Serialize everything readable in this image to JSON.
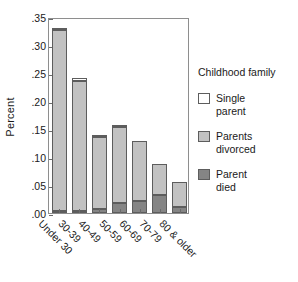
{
  "chart_data": {
    "type": "bar",
    "stacked": true,
    "title": "",
    "subtitle": "",
    "xlabel": "",
    "ylabel": "Percent",
    "categories": [
      "Under 30",
      "30-39",
      "40-49",
      "50-59",
      "60-69",
      "70-79",
      "80 & older"
    ],
    "ylim": [
      0.0,
      0.35
    ],
    "ytick_labels": [
      ".00",
      ".05",
      ".10",
      ".15",
      ".20",
      ".25",
      ".30",
      ".35"
    ],
    "ytick_values": [
      0.0,
      0.05,
      0.1,
      0.15,
      0.2,
      0.25,
      0.3,
      0.35
    ],
    "grid": false,
    "legend_position": "right",
    "legend_title": "Childhood family",
    "series": [
      {
        "name": "Parent died",
        "color": "#858585",
        "values": [
          0.004,
          0.004,
          0.008,
          0.018,
          0.022,
          0.032,
          0.011
        ]
      },
      {
        "name": "Parents divorced",
        "color": "#c2c2c2",
        "values": [
          0.323,
          0.231,
          0.127,
          0.135,
          0.107,
          0.056,
          0.044
        ]
      },
      {
        "name": "Single parent",
        "color": "#ffffff",
        "values": [
          0.004,
          0.006,
          0.005,
          0.004,
          0.0,
          0.0,
          0.0
        ]
      }
    ],
    "totals": [
      0.331,
      0.241,
      0.14,
      0.157,
      0.129,
      0.088,
      0.055
    ]
  },
  "legend": {
    "title": "Childhood family",
    "items": [
      {
        "label_line1": "Single",
        "label_line2": "parent",
        "swatch": "white-swatch"
      },
      {
        "label_line1": "Parents",
        "label_line2": "divorced",
        "swatch": "light-gray-swatch"
      },
      {
        "label_line1": "Parent",
        "label_line2": "died",
        "swatch": "dark-gray-swatch"
      }
    ]
  },
  "axes": {
    "y_title": "Percent"
  },
  "colors": {
    "single_parent": "#ffffff",
    "parents_divorced": "#c2c2c2",
    "parent_died": "#858585",
    "outline": "#5d5d5d",
    "frame": "#8e8e8e",
    "text": "#1a1a1a"
  }
}
